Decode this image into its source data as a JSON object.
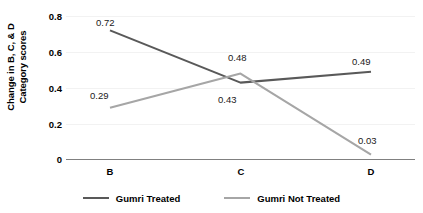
{
  "chart_data": {
    "type": "line",
    "title": "",
    "xlabel": "",
    "ylabel": "Change in B, C, & D Category scores",
    "ylabel_line1": "Change in B, C, & D",
    "ylabel_line2": "Category scores",
    "categories": [
      "B",
      "C",
      "D"
    ],
    "ylim": [
      0,
      0.8
    ],
    "yticks": [
      "0",
      "0.2",
      "0.4",
      "0.6",
      "0.8"
    ],
    "ytick_values": [
      0,
      0.2,
      0.4,
      0.6,
      0.8
    ],
    "grid": true,
    "legend_position": "bottom",
    "series": [
      {
        "name": "Gumri Treated",
        "color": "#595959",
        "values": [
          0.72,
          0.43,
          0.49
        ],
        "labels": [
          "0.72",
          "0.43",
          "0.49"
        ]
      },
      {
        "name": "Gumri Not Treated",
        "color": "#a6a6a6",
        "values": [
          0.29,
          0.48,
          0.03
        ],
        "labels": [
          "0.29",
          "0.48",
          "0.03"
        ]
      }
    ]
  },
  "axis": {
    "y_title_line1": "Change in B, C, & D",
    "y_title_line2": "Category scores",
    "y_tick_0": "0",
    "y_tick_1": "0.2",
    "y_tick_2": "0.4",
    "y_tick_3": "0.6",
    "y_tick_4": "0.8",
    "x_tick_0": "B",
    "x_tick_1": "C",
    "x_tick_2": "D"
  },
  "labels": {
    "treated_b": "0.72",
    "treated_c": "0.43",
    "treated_d": "0.49",
    "untreated_b": "0.29",
    "untreated_c": "0.48",
    "untreated_d": "0.03"
  },
  "legend": {
    "item1_label": "Gumri Treated",
    "item2_label": "Gumri Not Treated"
  },
  "colors": {
    "treated": "#595959",
    "untreated": "#a6a6a6",
    "axis": "#808080",
    "gridline": "#f2f2f2"
  }
}
